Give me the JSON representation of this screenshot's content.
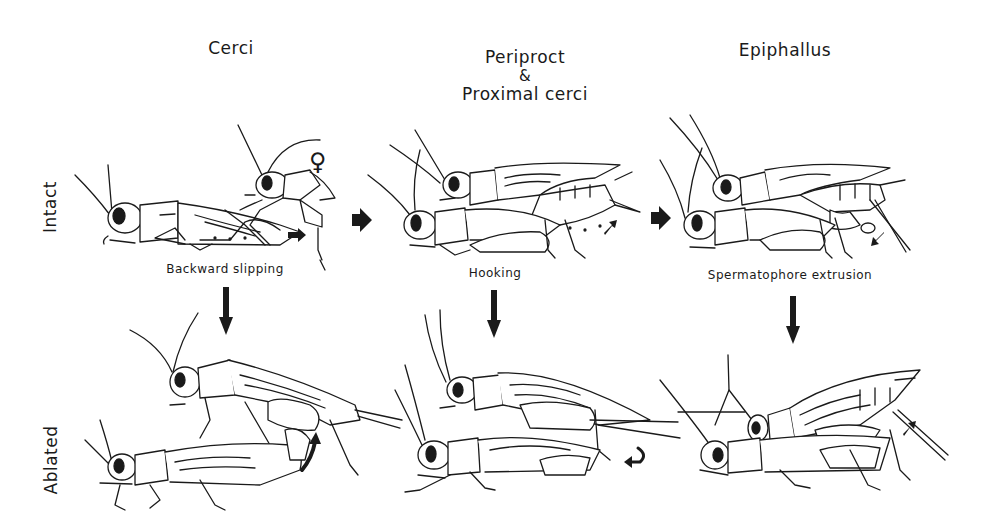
{
  "figure": {
    "columns": [
      {
        "title": "Cerci",
        "step_label": "Backward slipping"
      },
      {
        "title_line1": "Periproct",
        "title_line2": "&",
        "title_line3": "Proximal cerci",
        "step_label": "Hooking"
      },
      {
        "title": "Epiphallus",
        "step_label": "Spermatophore extrusion"
      }
    ],
    "rows": [
      {
        "label": "Intact"
      },
      {
        "label": "Ablated"
      }
    ],
    "annotations": {
      "female_symbol": "♀"
    },
    "colors": {
      "ink": "#1a1a1a",
      "background": "#ffffff"
    }
  }
}
